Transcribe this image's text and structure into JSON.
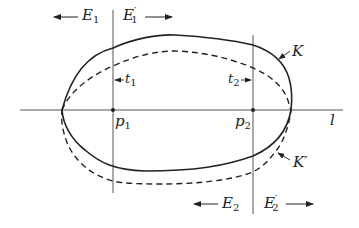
{
  "diagram": {
    "colors": {
      "stroke": "#222222",
      "background": "#ffffff"
    },
    "curves": {
      "K": {
        "label": "K",
        "style": "solid"
      },
      "K_prime": {
        "label": "K",
        "prime": "′",
        "style": "dashed"
      }
    },
    "lines": {
      "l": {
        "label": "l"
      },
      "t1": {
        "label": "t",
        "sub": "1"
      },
      "t2": {
        "label": "t",
        "sub": "2"
      }
    },
    "points": {
      "p1": {
        "label": "p",
        "sub": "1"
      },
      "p2": {
        "label": "p",
        "sub": "2"
      }
    },
    "half_planes": {
      "E1": {
        "label": "E",
        "sub": "1",
        "arrow": "left"
      },
      "E1_prime": {
        "label": "E",
        "sup": "′",
        "sub": "1",
        "arrow": "right"
      },
      "E2": {
        "label": "E",
        "sub": "2",
        "arrow": "left"
      },
      "E2_prime": {
        "label": "E",
        "sup": "′",
        "sub": "2",
        "arrow": "right"
      }
    }
  }
}
